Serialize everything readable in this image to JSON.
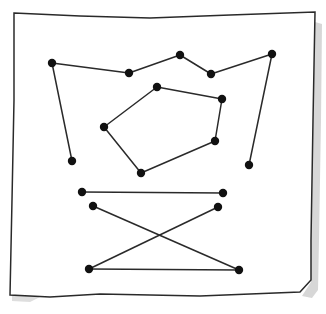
{
  "figure": {
    "colors": {
      "ink": "#2a2a2a",
      "dot": "#111111",
      "paper": "#ffffff",
      "shadow": "#bdbdbd"
    },
    "paper_outline": [
      [
        14,
        13
      ],
      [
        80,
        16
      ],
      [
        150,
        18
      ],
      [
        230,
        15
      ],
      [
        315,
        12
      ],
      [
        313,
        120
      ],
      [
        311,
        240
      ],
      [
        311,
        280
      ],
      [
        300,
        292
      ],
      [
        200,
        296
      ],
      [
        100,
        294
      ],
      [
        50,
        297
      ],
      [
        10,
        295
      ],
      [
        12,
        200
      ],
      [
        14,
        100
      ],
      [
        14,
        13
      ]
    ],
    "paths": [
      {
        "name": "crown-path",
        "closed": false,
        "points": [
          [
            72,
            161
          ],
          [
            52,
            63
          ],
          [
            129,
            73
          ],
          [
            180,
            55
          ],
          [
            211,
            74
          ],
          [
            272,
            54
          ],
          [
            249,
            165
          ]
        ]
      },
      {
        "name": "hexagon-shape",
        "closed": true,
        "points": [
          [
            157,
            87
          ],
          [
            222,
            99
          ],
          [
            215,
            141
          ],
          [
            141,
            173
          ],
          [
            104,
            127
          ]
        ]
      },
      {
        "name": "hourglass-path",
        "closed": false,
        "points": [
          [
            82,
            192
          ],
          [
            223,
            193
          ]
        ]
      },
      {
        "name": "hourglass-cross-a",
        "closed": false,
        "points": [
          [
            93,
            206
          ],
          [
            239,
            270
          ]
        ]
      },
      {
        "name": "hourglass-cross-b",
        "closed": false,
        "points": [
          [
            218,
            207
          ],
          [
            89,
            269
          ]
        ]
      },
      {
        "name": "hourglass-bottom",
        "closed": false,
        "points": [
          [
            89,
            269
          ],
          [
            239,
            270
          ]
        ]
      }
    ],
    "dots": [
      [
        52,
        63
      ],
      [
        129,
        73
      ],
      [
        180,
        55
      ],
      [
        211,
        74
      ],
      [
        272,
        54
      ],
      [
        72,
        161
      ],
      [
        249,
        165
      ],
      [
        157,
        87
      ],
      [
        222,
        99
      ],
      [
        215,
        141
      ],
      [
        141,
        173
      ],
      [
        104,
        127
      ],
      [
        82,
        192
      ],
      [
        223,
        193
      ],
      [
        93,
        206
      ],
      [
        218,
        207
      ],
      [
        89,
        269
      ],
      [
        239,
        270
      ]
    ]
  }
}
